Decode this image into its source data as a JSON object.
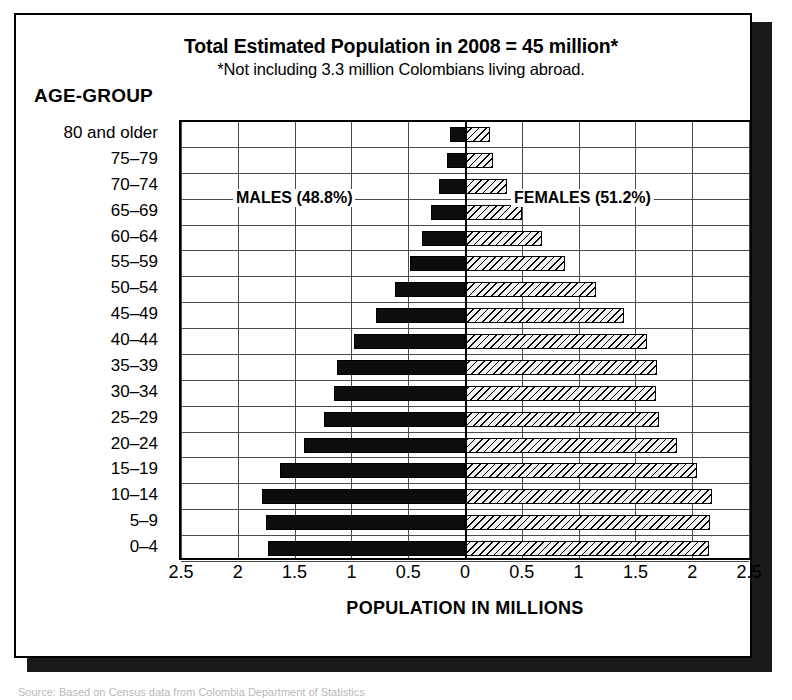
{
  "header": {
    "title": "Total Estimated Population in 2008 = 45 million*",
    "subtitle": "*Not including 3.3 million Colombians living abroad.",
    "age_group_heading": "AGE-GROUP"
  },
  "axis": {
    "x_title": "POPULATION IN MILLIONS",
    "x_ticks": [
      "2.5",
      "2",
      "1.5",
      "1",
      "0.5",
      "0",
      "0.5",
      "1",
      "1.5",
      "2",
      "2.5"
    ]
  },
  "legend": {
    "males": "MALES (48.8%)",
    "females": "FEMALES (51.2%)"
  },
  "caption": "Source: Based on Census data from Colombia Department of Statistics",
  "chart_data": {
    "type": "bar",
    "subtype": "population-pyramid",
    "title": "Total Estimated Population in 2008 = 45 million*",
    "subtitle": "*Not including 3.3 million Colombians living abroad.",
    "xlabel": "POPULATION IN MILLIONS",
    "ylabel": "AGE-GROUP",
    "xlim": [
      -2.5,
      2.5
    ],
    "x_tick_values": [
      2.5,
      2,
      1.5,
      1,
      0.5,
      0,
      0.5,
      1,
      1.5,
      2,
      2.5
    ],
    "grid": true,
    "legend_position": "inside-plot",
    "units": "millions",
    "categories": [
      "80 and older",
      "75–79",
      "70–74",
      "65–69",
      "60–64",
      "55–59",
      "50–54",
      "45–49",
      "40–44",
      "35–39",
      "30–34",
      "25–29",
      "20–24",
      "15–19",
      "10–14",
      "5–9",
      "0–4"
    ],
    "series": [
      {
        "name": "MALES (48.8%)",
        "direction": "left",
        "color": "#0d0d0d",
        "fill": "solid",
        "share_percent": 48.8,
        "values": [
          0.13,
          0.16,
          0.23,
          0.3,
          0.38,
          0.48,
          0.62,
          0.78,
          0.98,
          1.13,
          1.15,
          1.24,
          1.42,
          1.63,
          1.79,
          1.75,
          1.73
        ]
      },
      {
        "name": "FEMALES (51.2%)",
        "direction": "right",
        "color": "#f2f2f2",
        "fill": "diagonal-hatch",
        "share_percent": 51.2,
        "values": [
          0.22,
          0.25,
          0.37,
          0.5,
          0.68,
          0.88,
          1.15,
          1.4,
          1.6,
          1.69,
          1.68,
          1.71,
          1.87,
          2.04,
          2.17,
          2.16,
          2.15
        ]
      }
    ]
  }
}
